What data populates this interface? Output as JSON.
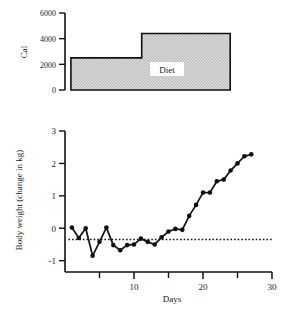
{
  "figure": {
    "background": "#ffffff",
    "ink": "#111111",
    "fill_color": "#d9d9d9",
    "panels": [
      "diet-panel",
      "bodyweight-panel"
    ]
  },
  "chart_data": [
    {
      "id": "diet-panel",
      "type": "area",
      "title": "",
      "xlabel": "",
      "ylabel": "Cal",
      "ylim": [
        0,
        6000
      ],
      "yticks": [
        0,
        2000,
        4000,
        6000
      ],
      "ytick_labels": [
        "0",
        "2000",
        "4000",
        "6000"
      ],
      "xlim": [
        0,
        30
      ],
      "xticks": [],
      "xtick_labels": [],
      "grid": false,
      "legend": "none",
      "step_style": "post",
      "x": [
        1,
        13,
        13,
        28
      ],
      "values": [
        2500,
        2500,
        4400,
        4400
      ],
      "annotations": [
        {
          "text": "Diet",
          "x": 19.5,
          "y": 1700,
          "boxed": true
        }
      ]
    },
    {
      "id": "bodyweight-panel",
      "type": "line",
      "title": "",
      "xlabel": "Days",
      "ylabel": "Body weight (change in kg)",
      "ylim": [
        -1.35,
        3
      ],
      "yticks": [
        -1,
        0,
        1,
        2,
        3
      ],
      "ytick_labels": [
        "-1",
        "0",
        "1",
        "2",
        "3"
      ],
      "xlim": [
        0,
        30
      ],
      "xticks": [
        10,
        20,
        30
      ],
      "xtick_labels": [
        "10",
        "20",
        "30"
      ],
      "xticks_minor": [
        5,
        15,
        25
      ],
      "grid": false,
      "legend": "none",
      "marker": "filled-circle",
      "series": [
        {
          "name": "Body weight change",
          "x": [
            1,
            2,
            3,
            4,
            5,
            6,
            7,
            8,
            9,
            10,
            11,
            12,
            13,
            14,
            15,
            16,
            17,
            18,
            19,
            20,
            21,
            22,
            23,
            24,
            25,
            26,
            27
          ],
          "values": [
            0.02,
            -0.3,
            0.0,
            -0.85,
            -0.42,
            0.02,
            -0.52,
            -0.68,
            -0.52,
            -0.5,
            -0.32,
            -0.42,
            -0.5,
            -0.28,
            -0.1,
            -0.02,
            -0.05,
            0.38,
            0.72,
            1.1,
            1.1,
            1.45,
            1.5,
            1.78,
            2.0,
            2.22,
            2.28
          ]
        }
      ],
      "reference_line": {
        "type": "dotted-horizontal",
        "y": -0.35,
        "x_start": 0.5,
        "x_end": 30
      }
    }
  ]
}
